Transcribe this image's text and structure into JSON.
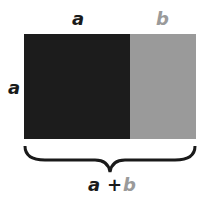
{
  "diagram": {
    "labels": {
      "top_a": "a",
      "top_b": "b",
      "side_a": "a",
      "sum_a": "a",
      "sum_plus": "+",
      "sum_b": "b"
    },
    "colors": {
      "dark": "#1c1c1c",
      "gray": "#9a9a9a",
      "text_dark": "#1a1a1a",
      "text_gray": "#9a9a9a"
    }
  }
}
